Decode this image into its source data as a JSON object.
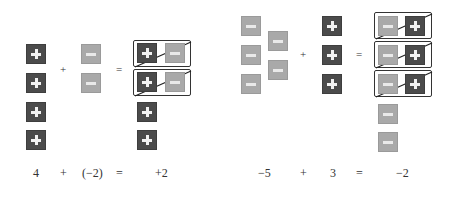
{
  "colors": {
    "positive_tile": "#4b4b4b",
    "negative_tile": "#a9a9a9",
    "symbol": "#f2f2f2",
    "outline": "#333333"
  },
  "left_example": {
    "operator_plus": "+",
    "operator_equals": "=",
    "addend1_tiles": [
      "positive",
      "positive",
      "positive",
      "positive"
    ],
    "addend2_tiles": [
      "negative",
      "negative"
    ],
    "zero_pairs": [
      [
        "positive",
        "negative"
      ],
      [
        "positive",
        "negative"
      ]
    ],
    "result_tiles": [
      "positive",
      "positive"
    ],
    "equation": {
      "a": "4",
      "op": "+",
      "b": "(−2)",
      "eq": "=",
      "result": "+2"
    }
  },
  "right_example": {
    "operator_plus": "+",
    "operator_equals": "=",
    "addend1_tiles": [
      "negative",
      "negative",
      "negative",
      "negative",
      "negative"
    ],
    "addend2_tiles": [
      "positive",
      "positive",
      "positive"
    ],
    "zero_pairs": [
      [
        "negative",
        "positive"
      ],
      [
        "negative",
        "positive"
      ],
      [
        "negative",
        "positive"
      ]
    ],
    "result_tiles": [
      "negative",
      "negative"
    ],
    "equation": {
      "a": "−5",
      "op": "+",
      "b": "3",
      "eq": "=",
      "result": "−2"
    }
  }
}
